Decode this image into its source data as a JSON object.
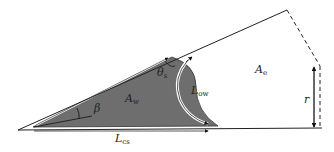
{
  "diagram": {
    "type": "geometric-wedge-figure",
    "colors": {
      "background": "#ffffff",
      "line": "#222222",
      "shaded_region": "#6e6e6e",
      "arrow_fill": "#ffffff"
    },
    "labels": {
      "beta": {
        "main": "β",
        "sub": ""
      },
      "theta_s": {
        "main": "θ",
        "sub": "s"
      },
      "A_w": {
        "main": "A",
        "sub": "w"
      },
      "A_e": {
        "main": "A",
        "sub": "e"
      },
      "L_ow": {
        "main": "L",
        "sub": "ow"
      },
      "L_cs": {
        "main": "L",
        "sub": "cs"
      },
      "r": {
        "main": "r",
        "sub": ""
      }
    }
  }
}
